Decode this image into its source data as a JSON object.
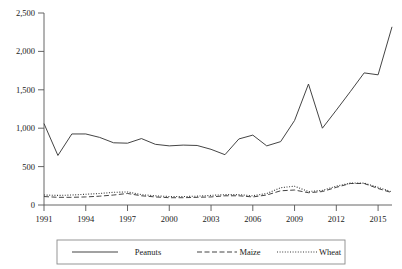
{
  "chart_data": {
    "type": "line",
    "title": "",
    "xlabel": "",
    "ylabel": "",
    "x": [
      1991,
      1992,
      1993,
      1994,
      1995,
      1996,
      1997,
      1998,
      1999,
      2000,
      2001,
      2002,
      2003,
      2004,
      2005,
      2006,
      2007,
      2008,
      2009,
      2010,
      2011,
      2012,
      2013,
      2014,
      2015,
      2016
    ],
    "xlim": [
      1991,
      2016
    ],
    "ylim": [
      0,
      2500
    ],
    "yticks": [
      0,
      500,
      1000,
      1500,
      2000,
      2500
    ],
    "ytick_labels": [
      "0",
      "500",
      "1,000",
      "1,500",
      "2,000",
      "2,500"
    ],
    "xticks": [
      1991,
      1994,
      1997,
      2000,
      2003,
      2006,
      2009,
      2012,
      2015
    ],
    "xtick_labels": [
      "1991",
      "1994",
      "1997",
      "2000",
      "2003",
      "2006",
      "2009",
      "2012",
      "2015"
    ],
    "grid": false,
    "legend_position": "below",
    "series": [
      {
        "name": "Peanuts",
        "style": "solid",
        "color": "#3a3a3a",
        "values": [
          1060,
          645,
          925,
          925,
          880,
          810,
          805,
          865,
          790,
          770,
          780,
          775,
          725,
          655,
          860,
          910,
          770,
          825,
          1100,
          1575,
          1000,
          1235,
          1475,
          1720,
          1695,
          2320
        ]
      },
      {
        "name": "Maize",
        "style": "dashed",
        "color": "#3a3a3a",
        "values": [
          110,
          100,
          100,
          105,
          115,
          130,
          150,
          120,
          105,
          95,
          95,
          100,
          105,
          120,
          120,
          105,
          130,
          185,
          195,
          160,
          175,
          230,
          280,
          280,
          215,
          160
        ]
      },
      {
        "name": "Wheat",
        "style": "dotted",
        "color": "#3a3a3a",
        "values": [
          130,
          125,
          130,
          140,
          150,
          165,
          170,
          135,
          120,
          110,
          110,
          115,
          125,
          135,
          135,
          120,
          150,
          225,
          245,
          175,
          190,
          245,
          285,
          285,
          230,
          170
        ]
      }
    ],
    "series_peanuts_full": {
      "1991": 1060,
      "1992": 645,
      "1993": 925,
      "1994": 925,
      "1995": 880,
      "1996": 810,
      "1997": 805,
      "1998": 865,
      "1999": 790,
      "2000": 770,
      "2001": 780,
      "2002": 775,
      "2003": 725,
      "2004": 655,
      "2005": 860,
      "2006": 910,
      "2007": 770,
      "2008": 825,
      "2009": 1100,
      "2010": 1575,
      "2011": 1000,
      "2012": 1235,
      "2013": 1475,
      "2014": 1720,
      "2015": 1695,
      "2016": 2320
    }
  },
  "legend": {
    "items": [
      {
        "label": "Peanuts",
        "style": "solid"
      },
      {
        "label": "Maize",
        "style": "dashed"
      },
      {
        "label": "Wheat",
        "style": "dotted"
      }
    ]
  },
  "axes": {
    "y_labels": [
      "2,500",
      "2,000",
      "1,500",
      "1,000",
      "500",
      "0"
    ],
    "x_labels": [
      "1991",
      "1994",
      "1997",
      "2000",
      "2003",
      "2006",
      "2009",
      "2012",
      "2015"
    ]
  },
  "colors": {
    "line": "#3a3a3a",
    "axis": "#555555",
    "background": "#ffffff",
    "legend_border": "#8a8a8a"
  }
}
